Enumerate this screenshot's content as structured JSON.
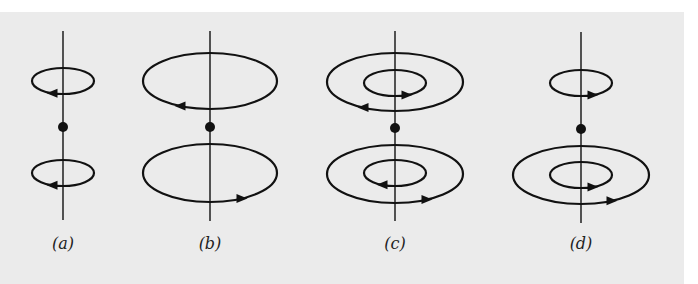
{
  "figure": {
    "background_color": "#ebebeb",
    "stroke_color": "#111111",
    "panels": [
      {
        "id": "a",
        "label": "(a)",
        "axis_x": 63,
        "axis_top": 31,
        "axis_bottom": 220,
        "dot": {
          "cx": 63,
          "cy": 127,
          "r": 5
        },
        "loops": [
          {
            "cx": 63,
            "cy": 81,
            "rx": 31,
            "ry": 13,
            "arrow_x": 52,
            "direction": "left",
            "position": "upper-small"
          },
          {
            "cx": 63,
            "cy": 173,
            "rx": 31,
            "ry": 13,
            "arrow_x": 52,
            "direction": "left",
            "position": "lower-small"
          }
        ]
      },
      {
        "id": "b",
        "label": "(b)",
        "axis_x": 210,
        "axis_top": 31,
        "axis_bottom": 221,
        "dot": {
          "cx": 210,
          "cy": 127,
          "r": 5
        },
        "loops": [
          {
            "cx": 210,
            "cy": 81,
            "rx": 67,
            "ry": 28,
            "arrow_x": 180,
            "direction": "left",
            "position": "upper-large"
          },
          {
            "cx": 210,
            "cy": 173,
            "rx": 67,
            "ry": 29,
            "arrow_x": 242,
            "direction": "right",
            "position": "lower-large"
          }
        ]
      },
      {
        "id": "c",
        "label": "(c)",
        "axis_x": 395,
        "axis_top": 31,
        "axis_bottom": 221,
        "dot": {
          "cx": 395,
          "cy": 128,
          "r": 5
        },
        "loops": [
          {
            "cx": 395,
            "cy": 82,
            "rx": 68,
            "ry": 29,
            "arrow_x": 363,
            "direction": "left",
            "position": "upper-outer"
          },
          {
            "cx": 395,
            "cy": 83,
            "rx": 31,
            "ry": 13,
            "arrow_x": 407,
            "direction": "right",
            "position": "upper-inner"
          },
          {
            "cx": 395,
            "cy": 174,
            "rx": 68,
            "ry": 29,
            "arrow_x": 427,
            "direction": "right",
            "position": "lower-outer"
          },
          {
            "cx": 395,
            "cy": 173,
            "rx": 31,
            "ry": 13,
            "arrow_x": 382,
            "direction": "left",
            "position": "lower-inner"
          }
        ]
      },
      {
        "id": "d",
        "label": "(d)",
        "axis_x": 581,
        "axis_top": 32,
        "axis_bottom": 223,
        "dot": {
          "cx": 581,
          "cy": 129,
          "r": 5
        },
        "loops": [
          {
            "cx": 581,
            "cy": 83,
            "rx": 31,
            "ry": 13,
            "arrow_x": 593,
            "direction": "right",
            "position": "upper-small"
          },
          {
            "cx": 581,
            "cy": 175,
            "rx": 68,
            "ry": 29,
            "arrow_x": 612,
            "direction": "right",
            "position": "lower-outer"
          },
          {
            "cx": 581,
            "cy": 175,
            "rx": 31,
            "ry": 13,
            "arrow_x": 593,
            "direction": "right",
            "position": "lower-inner"
          }
        ]
      }
    ],
    "label_y": 249
  }
}
